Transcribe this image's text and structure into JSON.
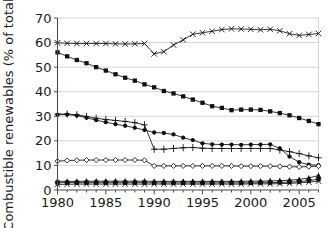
{
  "chart_data": {
    "type": "line",
    "title": "",
    "xlabel": "",
    "ylabel": "Combustible renewables (% of total)",
    "xlim": [
      1980,
      2007
    ],
    "ylim": [
      0,
      70
    ],
    "ytick_step": 10,
    "yticks": [
      0,
      10,
      20,
      30,
      40,
      50,
      60,
      70
    ],
    "ytick_labels": [
      "0",
      "10",
      "20",
      "30",
      "40",
      "50",
      "60",
      "70"
    ],
    "xticks_major": [
      1980,
      1985,
      1990,
      1995,
      2000,
      2005
    ],
    "xtick_labels": [
      "1980",
      "1985",
      "1990",
      "1995",
      "2000",
      "2005"
    ],
    "xticks_minor_step": 1,
    "grid": "horizontal",
    "legend": "none",
    "x": [
      1980,
      1981,
      1982,
      1983,
      1984,
      1985,
      1986,
      1987,
      1988,
      1989,
      1990,
      1991,
      1992,
      1993,
      1994,
      1995,
      1996,
      1997,
      1998,
      1999,
      2000,
      2001,
      2002,
      2003,
      2004,
      2005,
      2006,
      2007
    ],
    "series": [
      {
        "name": "series-cross-top",
        "marker": "cross",
        "values": [
          59.9,
          59.7,
          59.6,
          59.6,
          59.6,
          59.6,
          59.5,
          59.4,
          59.5,
          59.6,
          55.4,
          56.3,
          59.0,
          61.1,
          63.4,
          64.0,
          64.6,
          65.3,
          65.6,
          65.5,
          65.4,
          65.2,
          65.4,
          64.8,
          63.6,
          62.9,
          63.3,
          63.7
        ]
      },
      {
        "name": "series-square",
        "marker": "square-filled",
        "values": [
          56.0,
          54.4,
          52.9,
          51.6,
          50.0,
          48.6,
          47.1,
          45.7,
          44.5,
          43.0,
          41.8,
          40.3,
          39.3,
          38.1,
          36.8,
          35.5,
          34.1,
          33.4,
          32.5,
          32.7,
          32.7,
          32.6,
          32.0,
          31.3,
          30.4,
          29.3,
          28.1,
          26.8
        ]
      },
      {
        "name": "series-plus",
        "marker": "plus",
        "values": [
          30.9,
          30.9,
          30.6,
          29.9,
          29.2,
          28.7,
          28.3,
          27.9,
          27.4,
          26.5,
          16.6,
          16.6,
          16.9,
          17.2,
          17.3,
          17.0,
          16.9,
          16.9,
          16.9,
          16.9,
          16.9,
          16.9,
          16.9,
          16.3,
          15.6,
          14.8,
          13.9,
          13.1
        ]
      },
      {
        "name": "series-circle",
        "marker": "circle-filled",
        "values": [
          30.6,
          30.7,
          30.3,
          29.4,
          28.4,
          27.6,
          26.8,
          26.1,
          25.3,
          24.4,
          23.4,
          23.2,
          22.6,
          21.3,
          20.3,
          19.0,
          18.6,
          18.5,
          18.5,
          18.4,
          18.5,
          18.5,
          18.6,
          16.9,
          13.6,
          11.3,
          10.3,
          10.1
        ]
      },
      {
        "name": "series-open-diamond",
        "marker": "diamond-open",
        "values": [
          11.7,
          12.0,
          12.1,
          12.2,
          12.2,
          12.2,
          12.2,
          12.2,
          12.2,
          12.1,
          9.8,
          9.8,
          9.8,
          9.8,
          9.8,
          9.8,
          9.8,
          9.8,
          9.8,
          9.7,
          9.7,
          9.7,
          9.7,
          9.6,
          9.5,
          9.4,
          9.5,
          9.7
        ]
      },
      {
        "name": "series-triangle-low",
        "marker": "triangle-filled",
        "values": [
          3.6,
          3.5,
          3.5,
          3.6,
          3.6,
          3.6,
          3.6,
          3.6,
          3.6,
          3.6,
          3.5,
          3.5,
          3.5,
          3.5,
          3.5,
          3.5,
          3.5,
          3.5,
          3.5,
          3.5,
          3.6,
          3.6,
          3.7,
          3.8,
          4.0,
          4.3,
          4.9,
          5.9
        ]
      },
      {
        "name": "series-cross-low",
        "marker": "cross",
        "values": [
          2.3,
          2.3,
          2.4,
          2.4,
          2.4,
          2.4,
          2.4,
          2.4,
          2.4,
          2.4,
          2.4,
          2.4,
          2.4,
          2.4,
          2.4,
          2.4,
          2.4,
          2.4,
          2.4,
          2.4,
          2.5,
          2.5,
          2.5,
          2.6,
          2.7,
          2.9,
          3.2,
          3.6
        ]
      },
      {
        "name": "series-square-low",
        "marker": "square-filled",
        "values": [
          3.0,
          3.0,
          3.0,
          3.0,
          3.0,
          3.0,
          3.0,
          3.0,
          3.0,
          3.0,
          2.9,
          2.9,
          2.9,
          2.9,
          2.9,
          2.9,
          2.9,
          2.9,
          2.9,
          2.9,
          2.9,
          3.0,
          3.0,
          3.1,
          3.2,
          3.4,
          3.8,
          4.4
        ]
      }
    ]
  },
  "colors": {
    "ink": "#111111",
    "grid": "#c9c9c9",
    "axis": "#4d4d4d",
    "background": "#ffffff"
  }
}
